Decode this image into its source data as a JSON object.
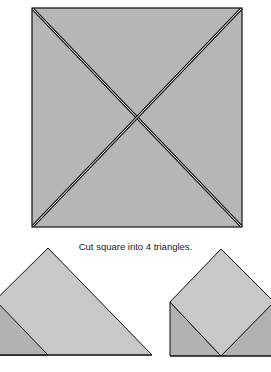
{
  "figure": {
    "caption": "Cut square into 4 triangles.",
    "colors": {
      "square_fill": "#b6b6b6",
      "light_fill": "#c8c8c8",
      "dark_fill": "#b2b2b2",
      "stroke": "#111111",
      "cut_gap": "#ffffff"
    }
  }
}
